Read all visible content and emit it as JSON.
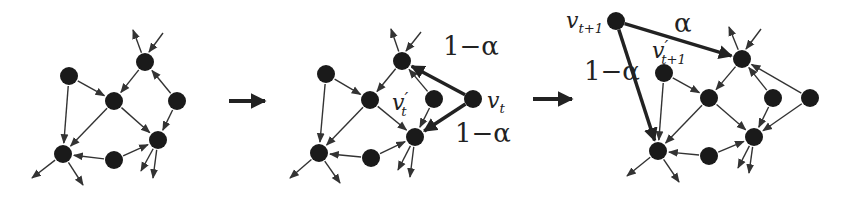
{
  "diagram": {
    "type": "network-evolution",
    "colors": {
      "node": "#1a1a1a",
      "edge": "#333333",
      "background": "#ffffff"
    },
    "transition_arrows": [
      {
        "x1": 229,
        "y1": 101,
        "x2": 265,
        "y2": 101
      },
      {
        "x1": 533,
        "y1": 99,
        "x2": 572,
        "y2": 99
      }
    ],
    "panels": [
      {
        "name": "initial-network",
        "nodes": [
          {
            "id": "a",
            "x": 145,
            "y": 62
          },
          {
            "id": "b",
            "x": 69,
            "y": 76
          },
          {
            "id": "c",
            "x": 114,
            "y": 101
          },
          {
            "id": "d",
            "x": 177,
            "y": 101
          },
          {
            "id": "e",
            "x": 158,
            "y": 140
          },
          {
            "id": "f",
            "x": 63,
            "y": 154
          },
          {
            "id": "g",
            "x": 114,
            "y": 160
          }
        ],
        "edges": [
          [
            "a",
            "c"
          ],
          [
            "d",
            "a"
          ],
          [
            "b",
            "c"
          ],
          [
            "b",
            "f"
          ],
          [
            "c",
            "f"
          ],
          [
            "c",
            "e"
          ],
          [
            "d",
            "e"
          ],
          [
            "g",
            "f"
          ],
          [
            "g",
            "e"
          ]
        ],
        "stubs": [
          {
            "from": [
              145,
              62
            ],
            "to": [
              133,
              30
            ]
          },
          {
            "from": [
              163,
              33
            ],
            "to": [
              149,
              52
            ],
            "incoming": true
          },
          {
            "from": [
              63,
              154
            ],
            "to": [
              32,
              178
            ]
          },
          {
            "from": [
              63,
              154
            ],
            "to": [
              83,
              185
            ]
          },
          {
            "from": [
              158,
              140
            ],
            "to": [
              141,
              171
            ]
          },
          {
            "from": [
              158,
              140
            ],
            "to": [
              153,
              178
            ]
          }
        ]
      },
      {
        "name": "new-node-attach",
        "nodes": [
          {
            "id": "a",
            "x": 402,
            "y": 61
          },
          {
            "id": "b",
            "x": 326,
            "y": 74
          },
          {
            "id": "c",
            "x": 370,
            "y": 100
          },
          {
            "id": "vp",
            "x": 434,
            "y": 99
          },
          {
            "id": "e",
            "x": 415,
            "y": 137
          },
          {
            "id": "f",
            "x": 319,
            "y": 153
          },
          {
            "id": "g",
            "x": 371,
            "y": 158
          },
          {
            "id": "vt",
            "x": 473,
            "y": 99,
            "new": true
          }
        ],
        "edges": [
          [
            "a",
            "c"
          ],
          [
            "vp",
            "a"
          ],
          [
            "b",
            "c"
          ],
          [
            "b",
            "f"
          ],
          [
            "c",
            "f"
          ],
          [
            "c",
            "e"
          ],
          [
            "vp",
            "e"
          ],
          [
            "g",
            "f"
          ],
          [
            "g",
            "e"
          ]
        ],
        "stubs": [
          {
            "from": [
              402,
              61
            ],
            "to": [
              391,
              29
            ]
          },
          {
            "from": [
              421,
              32
            ],
            "to": [
              406,
              51
            ],
            "incoming": true
          },
          {
            "from": [
              319,
              153
            ],
            "to": [
              290,
              178
            ]
          },
          {
            "from": [
              319,
              153
            ],
            "to": [
              340,
              183
            ]
          },
          {
            "from": [
              415,
              137
            ],
            "to": [
              398,
              170
            ]
          },
          {
            "from": [
              415,
              137
            ],
            "to": [
              410,
              177
            ]
          }
        ],
        "heavy_edges": [
          [
            "vt",
            "a"
          ],
          [
            "vt",
            "e"
          ]
        ],
        "labels": [
          {
            "text": "1−α",
            "x": 443,
            "y": 55,
            "size": 26,
            "italic": false
          },
          {
            "text": "1−α",
            "x": 455,
            "y": 142,
            "size": 26,
            "italic": false
          },
          {
            "text": "v",
            "sub": "t",
            "prime": "′",
            "x": 392,
            "y": 110,
            "size": 22,
            "italic": true
          },
          {
            "text": "v",
            "sub": "t",
            "x": 487,
            "y": 108,
            "size": 22,
            "italic": true
          }
        ]
      },
      {
        "name": "next-step-network",
        "nodes": [
          {
            "id": "vt1",
            "x": 616,
            "y": 21,
            "new": true
          },
          {
            "id": "vp1",
            "x": 664,
            "y": 73
          },
          {
            "id": "a",
            "x": 742,
            "y": 59
          },
          {
            "id": "c",
            "x": 709,
            "y": 98
          },
          {
            "id": "d1",
            "x": 773,
            "y": 98
          },
          {
            "id": "d2",
            "x": 810,
            "y": 98
          },
          {
            "id": "e",
            "x": 754,
            "y": 137
          },
          {
            "id": "f",
            "x": 658,
            "y": 151
          },
          {
            "id": "g",
            "x": 709,
            "y": 156
          }
        ],
        "edges": [
          [
            "a",
            "c"
          ],
          [
            "d1",
            "a"
          ],
          [
            "d2",
            "a"
          ],
          [
            "vp1",
            "c"
          ],
          [
            "vp1",
            "f"
          ],
          [
            "c",
            "f"
          ],
          [
            "c",
            "e"
          ],
          [
            "d1",
            "e"
          ],
          [
            "d2",
            "e"
          ],
          [
            "g",
            "f"
          ],
          [
            "g",
            "e"
          ]
        ],
        "stubs": [
          {
            "from": [
              742,
              59
            ],
            "to": [
              729,
              27
            ]
          },
          {
            "from": [
              761,
              29
            ],
            "to": [
              746,
              49
            ],
            "incoming": true
          },
          {
            "from": [
              658,
              151
            ],
            "to": [
              627,
              176
            ]
          },
          {
            "from": [
              658,
              151
            ],
            "to": [
              679,
              182
            ]
          },
          {
            "from": [
              754,
              137
            ],
            "to": [
              738,
              168
            ]
          },
          {
            "from": [
              754,
              137
            ],
            "to": [
              749,
              173
            ]
          }
        ],
        "heavy_edges": [
          [
            "vt1",
            "a"
          ],
          [
            "vt1",
            "f"
          ]
        ],
        "labels": [
          {
            "text": "α",
            "x": 674,
            "y": 32,
            "size": 26,
            "italic": false
          },
          {
            "text": "1−α",
            "x": 584,
            "y": 80,
            "size": 26,
            "italic": false
          },
          {
            "text": "v",
            "sub": "t+1",
            "x": 566,
            "y": 28,
            "size": 22,
            "italic": true
          },
          {
            "text": "v",
            "sub": "t+1",
            "prime": "′",
            "x": 652,
            "y": 58,
            "size": 22,
            "italic": true
          }
        ]
      }
    ]
  }
}
